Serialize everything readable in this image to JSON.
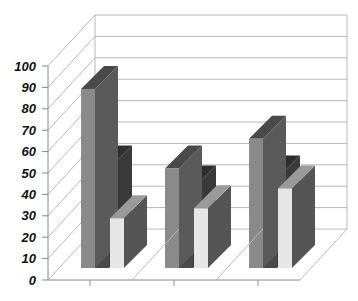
{
  "chart_data": {
    "type": "bar",
    "subtype": "3d-clustered-column",
    "title": "",
    "xlabel": "",
    "ylabel": "",
    "categories": [
      "",
      "",
      ""
    ],
    "series": [
      {
        "name": "Series 1",
        "values": [
          90,
          50,
          65
        ],
        "front_color": "#8a8a8a",
        "side_color": "#5a5a5a",
        "top_color": "#4a4a4a"
      },
      {
        "name": "Series 2",
        "values": [
          50,
          40,
          45
        ],
        "front_color": "#4a4a4a",
        "side_color": "#3a3a3a",
        "top_color": "#2e2e2e"
      },
      {
        "name": "Series 3",
        "values": [
          25,
          30,
          40
        ],
        "front_color": "#e6e6e6",
        "side_color": "#555555",
        "top_color": "#9a9a9a"
      }
    ],
    "yticks": [
      "0",
      "10",
      "20",
      "30",
      "40",
      "50",
      "60",
      "70",
      "80",
      "90",
      "100"
    ],
    "ylim": [
      0,
      100
    ],
    "grid": true,
    "legend": "none"
  },
  "colors": {
    "grid": "#b8b8b8",
    "axis": "#888888",
    "background": "#ffffff"
  }
}
